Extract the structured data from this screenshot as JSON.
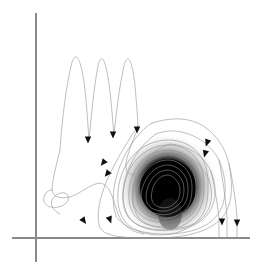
{
  "figure": {
    "width": 269,
    "height": 266,
    "background": "#ffffff"
  },
  "colors": {
    "axis": "#8a8a8a",
    "trajectory": "#9a9a9a",
    "arrowhead": "#111111",
    "core_dark": "#000000",
    "core_halo": "#bdbdbd"
  },
  "axes": {
    "x_axis": {
      "label": "",
      "x1": 12,
      "y1": 238,
      "x2": 250,
      "y2": 238
    },
    "y_axis": {
      "label": "",
      "x1": 36,
      "y1": 13,
      "x2": 36,
      "y2": 262
    },
    "ticks": [],
    "tick_labels": [],
    "grid": false
  },
  "chart_data": {
    "type": "line",
    "title": "",
    "xlabel": "",
    "ylabel": "",
    "xlim": [
      0,
      269
    ],
    "ylim": [
      0,
      266
    ],
    "grid": false,
    "legend": null,
    "series": [
      {
        "name": "oscillation-segment",
        "comment": "damped high-frequency oscillation, 3 peaks, upper-left",
        "points": [
          [
            60,
            148
          ],
          [
            62,
            130
          ],
          [
            64,
            110
          ],
          [
            66,
            92
          ],
          [
            68,
            78
          ],
          [
            70,
            68
          ],
          [
            72,
            62
          ],
          [
            74,
            60
          ],
          [
            76,
            63
          ],
          [
            78,
            70
          ],
          [
            80,
            82
          ],
          [
            82,
            98
          ],
          [
            84,
            115
          ],
          [
            86,
            128
          ],
          [
            87,
            136
          ],
          [
            88,
            140
          ],
          [
            89,
            136
          ],
          [
            90,
            126
          ],
          [
            92,
            108
          ],
          [
            94,
            90
          ],
          [
            96,
            74
          ],
          [
            98,
            64
          ],
          [
            100,
            60
          ],
          [
            102,
            60
          ],
          [
            104,
            66
          ],
          [
            106,
            78
          ],
          [
            108,
            94
          ],
          [
            110,
            110
          ],
          [
            112,
            124
          ],
          [
            113,
            131
          ],
          [
            114,
            134
          ],
          [
            115,
            128
          ],
          [
            116,
            116
          ],
          [
            118,
            98
          ],
          [
            120,
            82
          ],
          [
            122,
            70
          ],
          [
            124,
            63
          ],
          [
            126,
            61
          ],
          [
            128,
            64
          ],
          [
            130,
            72
          ],
          [
            132,
            85
          ],
          [
            134,
            100
          ],
          [
            136,
            114
          ],
          [
            137,
            122
          ],
          [
            138,
            126
          ]
        ]
      },
      {
        "name": "descending-tail",
        "comment": "falls from oscillation toward lower-left hook",
        "points": [
          [
            60,
            148
          ],
          [
            58,
            158
          ],
          [
            56,
            168
          ],
          [
            54,
            176
          ],
          [
            53,
            182
          ],
          [
            52,
            188
          ],
          [
            52,
            193
          ],
          [
            54,
            197
          ],
          [
            58,
            199
          ],
          [
            64,
            199
          ],
          [
            70,
            197
          ],
          [
            76,
            193
          ],
          [
            82,
            188
          ],
          [
            88,
            184
          ],
          [
            94,
            182
          ],
          [
            100,
            183
          ],
          [
            106,
            188
          ],
          [
            110,
            196
          ],
          [
            113,
            206
          ],
          [
            116,
            216
          ],
          [
            120,
            224
          ],
          [
            126,
            230
          ],
          [
            134,
            233
          ],
          [
            144,
            234
          ]
        ]
      },
      {
        "name": "left-hook-spiral",
        "comment": "small loop / cusp near lower left",
        "points": [
          [
            52,
            188
          ],
          [
            48,
            190
          ],
          [
            45,
            194
          ],
          [
            44,
            199
          ],
          [
            46,
            204
          ],
          [
            51,
            207
          ],
          [
            57,
            208
          ],
          [
            63,
            206
          ],
          [
            68,
            202
          ],
          [
            70,
            197
          ],
          [
            68,
            193
          ],
          [
            62,
            192
          ],
          [
            56,
            194
          ],
          [
            52,
            199
          ],
          [
            51,
            205
          ],
          [
            54,
            210
          ],
          [
            59,
            213
          ]
        ]
      },
      {
        "name": "outer-loop-1",
        "comment": "outermost large irregular loop around attractor",
        "points": [
          [
            138,
            126
          ],
          [
            132,
            136
          ],
          [
            124,
            148
          ],
          [
            116,
            162
          ],
          [
            108,
            178
          ],
          [
            102,
            194
          ],
          [
            98,
            210
          ],
          [
            98,
            222
          ],
          [
            104,
            230
          ],
          [
            116,
            235
          ],
          [
            132,
            237
          ],
          [
            152,
            238
          ],
          [
            172,
            237
          ],
          [
            192,
            234
          ],
          [
            208,
            228
          ],
          [
            220,
            218
          ],
          [
            228,
            204
          ],
          [
            232,
            188
          ],
          [
            232,
            170
          ],
          [
            228,
            152
          ],
          [
            220,
            138
          ],
          [
            208,
            128
          ],
          [
            196,
            122
          ],
          [
            184,
            119
          ],
          [
            172,
            119
          ],
          [
            162,
            122
          ],
          [
            152,
            123
          ]
        ]
      },
      {
        "name": "outer-loop-2",
        "points": [
          [
            152,
            123
          ],
          [
            142,
            129
          ],
          [
            132,
            140
          ],
          [
            124,
            154
          ],
          [
            118,
            170
          ],
          [
            114,
            186
          ],
          [
            113,
            202
          ],
          [
            116,
            216
          ],
          [
            124,
            226
          ],
          [
            138,
            232
          ],
          [
            156,
            234
          ],
          [
            176,
            233
          ],
          [
            194,
            229
          ],
          [
            208,
            221
          ],
          [
            218,
            209
          ],
          [
            223,
            194
          ],
          [
            223,
            178
          ],
          [
            219,
            163
          ],
          [
            211,
            150
          ],
          [
            200,
            141
          ],
          [
            188,
            135
          ],
          [
            176,
            132
          ],
          [
            165,
            132
          ],
          [
            156,
            134
          ]
        ]
      },
      {
        "name": "outer-loop-3",
        "points": [
          [
            156,
            134
          ],
          [
            146,
            140
          ],
          [
            137,
            150
          ],
          [
            130,
            163
          ],
          [
            125,
            177
          ],
          [
            123,
            191
          ],
          [
            124,
            205
          ],
          [
            129,
            217
          ],
          [
            139,
            225
          ],
          [
            154,
            229
          ],
          [
            172,
            230
          ],
          [
            189,
            227
          ],
          [
            202,
            220
          ],
          [
            211,
            209
          ],
          [
            215,
            195
          ],
          [
            214,
            181
          ],
          [
            209,
            168
          ],
          [
            200,
            157
          ],
          [
            189,
            149
          ],
          [
            177,
            145
          ],
          [
            167,
            144
          ]
        ]
      },
      {
        "name": "inner-loops-stack",
        "comment": "tight nested contours collapsing onto core",
        "loops": [
          {
            "cx": 168,
            "cy": 186,
            "rx": 44,
            "ry": 47,
            "rot": -6
          },
          {
            "cx": 168,
            "cy": 186,
            "rx": 40,
            "ry": 43,
            "rot": -4
          },
          {
            "cx": 168,
            "cy": 186,
            "rx": 36,
            "ry": 39,
            "rot": -2
          },
          {
            "cx": 168,
            "cy": 186,
            "rx": 32,
            "ry": 35,
            "rot": 0
          },
          {
            "cx": 168,
            "cy": 186,
            "rx": 28,
            "ry": 31,
            "rot": 2
          },
          {
            "cx": 168,
            "cy": 186,
            "rx": 24,
            "ry": 27,
            "rot": 4
          },
          {
            "cx": 168,
            "cy": 186,
            "rx": 20,
            "ry": 23,
            "rot": 6
          },
          {
            "cx": 168,
            "cy": 186,
            "rx": 17,
            "ry": 19,
            "rot": 8
          }
        ]
      },
      {
        "name": "right-descent-1",
        "comment": "long arc down the right side to the x axis",
        "points": [
          [
            232,
            170
          ],
          [
            234,
            186
          ],
          [
            236,
            200
          ],
          [
            237,
            212
          ],
          [
            237,
            224
          ],
          [
            237,
            234
          ],
          [
            237,
            238
          ]
        ]
      },
      {
        "name": "right-descent-2",
        "points": [
          [
            223,
            178
          ],
          [
            225,
            192
          ],
          [
            227,
            206
          ],
          [
            228,
            218
          ],
          [
            228,
            230
          ],
          [
            228,
            238
          ]
        ]
      },
      {
        "name": "right-descent-3",
        "points": [
          [
            214,
            181
          ],
          [
            216,
            195
          ],
          [
            218,
            208
          ],
          [
            219,
            220
          ],
          [
            219,
            231
          ],
          [
            219,
            238
          ]
        ]
      }
    ],
    "attractor_core": {
      "name": "dense-attractor-core",
      "center": [
        168,
        186
      ],
      "radius_dark": 27,
      "radius_halo": 52,
      "description": "very dense overplotted trajectory forming a black blob with soft gray halo"
    },
    "arrowheads": [
      {
        "x": 88,
        "y": 140,
        "angle": 180,
        "label": "flow-arrow-1"
      },
      {
        "x": 113,
        "y": 134,
        "angle": 180,
        "label": "flow-arrow-2"
      },
      {
        "x": 137,
        "y": 129,
        "angle": 180,
        "label": "flow-arrow-3"
      },
      {
        "x": 103,
        "y": 163,
        "angle": 120,
        "label": "flow-arrow-4"
      },
      {
        "x": 107,
        "y": 173,
        "angle": 120,
        "label": "flow-arrow-5"
      },
      {
        "x": 84,
        "y": 220,
        "angle": 45,
        "label": "flow-arrow-6"
      },
      {
        "x": 110,
        "y": 219,
        "angle": 25,
        "label": "flow-arrow-7"
      },
      {
        "x": 207,
        "y": 142,
        "angle": 165,
        "label": "flow-arrow-8"
      },
      {
        "x": 205,
        "y": 153,
        "angle": 170,
        "label": "flow-arrow-9"
      },
      {
        "x": 222,
        "y": 221,
        "angle": 180,
        "label": "flow-arrow-10"
      },
      {
        "x": 237,
        "y": 222,
        "angle": 180,
        "label": "flow-arrow-11"
      }
    ]
  }
}
